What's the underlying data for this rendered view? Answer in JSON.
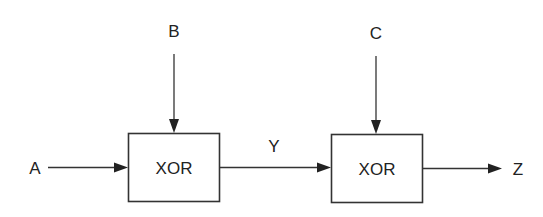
{
  "diagram": {
    "type": "block-diagram",
    "title": "",
    "colors": {
      "line": "#333333",
      "text": "#222222",
      "background": "#ffffff"
    },
    "inputs": [
      {
        "id": "A",
        "label": "A"
      },
      {
        "id": "B",
        "label": "B"
      },
      {
        "id": "C",
        "label": "C"
      }
    ],
    "gates": [
      {
        "id": "g1",
        "label": "XOR",
        "inputs": [
          "A",
          "B"
        ],
        "output": "Y"
      },
      {
        "id": "g2",
        "label": "XOR",
        "inputs": [
          "Y",
          "C"
        ],
        "output": "Z"
      }
    ],
    "intermediate": {
      "id": "Y",
      "label": "Y"
    },
    "outputs": [
      {
        "id": "Z",
        "label": "Z"
      }
    ],
    "edges": [
      {
        "from": "A",
        "to": "g1"
      },
      {
        "from": "B",
        "to": "g1"
      },
      {
        "from": "g1",
        "to": "g2",
        "label": "Y"
      },
      {
        "from": "C",
        "to": "g2"
      },
      {
        "from": "g2",
        "to": "Z"
      }
    ]
  }
}
